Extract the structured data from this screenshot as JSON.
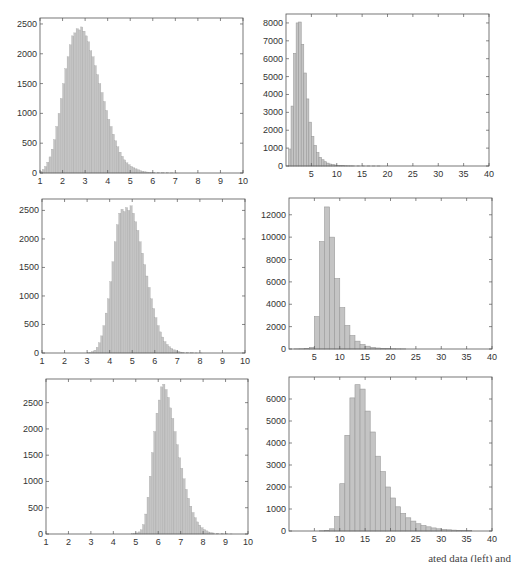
{
  "chart_data": [
    {
      "id": "row1-left",
      "type": "bar",
      "title": "",
      "xlabel": "",
      "ylabel": "",
      "xlim": [
        1,
        10
      ],
      "ylim": [
        0,
        2600
      ],
      "xticks": [
        1,
        2,
        3,
        4,
        5,
        6,
        7,
        8,
        9,
        10
      ],
      "yticks": [
        0,
        500,
        1000,
        1500,
        2000,
        2500
      ],
      "bin_width": 0.1,
      "x": [
        1.0,
        1.1,
        1.2,
        1.3,
        1.4,
        1.5,
        1.6,
        1.7,
        1.8,
        1.9,
        2.0,
        2.1,
        2.2,
        2.3,
        2.4,
        2.5,
        2.6,
        2.7,
        2.8,
        2.9,
        3.0,
        3.1,
        3.2,
        3.3,
        3.4,
        3.5,
        3.6,
        3.7,
        3.8,
        3.9,
        4.0,
        4.1,
        4.2,
        4.3,
        4.4,
        4.5,
        4.6,
        4.7,
        4.8,
        4.9,
        5.0,
        5.1,
        5.2,
        5.3,
        5.4,
        5.5,
        5.6,
        5.7,
        5.8,
        5.9,
        6.0,
        6.2,
        6.4,
        6.6,
        6.8,
        7.0
      ],
      "values": [
        30,
        60,
        110,
        180,
        270,
        400,
        560,
        780,
        1000,
        1250,
        1500,
        1750,
        1950,
        2150,
        2300,
        2350,
        2420,
        2400,
        2450,
        2380,
        2300,
        2200,
        2050,
        1950,
        1800,
        1650,
        1500,
        1350,
        1200,
        1050,
        900,
        780,
        650,
        540,
        440,
        350,
        280,
        220,
        170,
        140,
        110,
        90,
        70,
        55,
        40,
        30,
        22,
        16,
        12,
        9,
        7,
        5,
        4,
        3,
        2,
        1
      ],
      "grid": false
    },
    {
      "id": "row1-right",
      "type": "bar",
      "title": "",
      "xlabel": "",
      "ylabel": "",
      "xlim": [
        0,
        40
      ],
      "ylim": [
        0,
        8500
      ],
      "xticks": [
        5,
        10,
        15,
        20,
        25,
        30,
        35,
        40
      ],
      "yticks": [
        0,
        1000,
        2000,
        3000,
        4000,
        5000,
        6000,
        7000,
        8000
      ],
      "bin_width": 0.5,
      "x": [
        0.5,
        1.0,
        1.5,
        2.0,
        2.5,
        3.0,
        3.5,
        4.0,
        4.5,
        5.0,
        5.5,
        6.0,
        6.5,
        7.0,
        7.5,
        8.0,
        8.5,
        9.0,
        9.5,
        10.0,
        10.5,
        11.0,
        11.5,
        12.0,
        12.5,
        13.0,
        14,
        15,
        16,
        17,
        18
      ],
      "values": [
        950,
        3350,
        6300,
        8000,
        8050,
        6800,
        5200,
        3750,
        2450,
        1650,
        1150,
        750,
        480,
        350,
        240,
        160,
        110,
        80,
        55,
        40,
        30,
        22,
        16,
        12,
        9,
        7,
        5,
        4,
        3,
        2,
        1
      ],
      "grid": false
    },
    {
      "id": "row2-left",
      "type": "bar",
      "title": "",
      "xlabel": "",
      "ylabel": "",
      "xlim": [
        1,
        10
      ],
      "ylim": [
        0,
        2700
      ],
      "xticks": [
        1,
        2,
        3,
        4,
        5,
        6,
        7,
        8,
        9,
        10
      ],
      "yticks": [
        0,
        500,
        1000,
        1500,
        2000,
        2500
      ],
      "bin_width": 0.1,
      "x": [
        3.0,
        3.1,
        3.2,
        3.3,
        3.4,
        3.5,
        3.6,
        3.7,
        3.8,
        3.9,
        4.0,
        4.1,
        4.2,
        4.3,
        4.4,
        4.5,
        4.6,
        4.7,
        4.8,
        4.9,
        5.0,
        5.1,
        5.2,
        5.3,
        5.4,
        5.5,
        5.6,
        5.7,
        5.8,
        5.9,
        6.0,
        6.1,
        6.2,
        6.3,
        6.4,
        6.5,
        6.6,
        6.7,
        6.8,
        6.9,
        7.0,
        7.1,
        7.2,
        7.4,
        7.6,
        7.8,
        8.0
      ],
      "values": [
        5,
        10,
        25,
        50,
        100,
        180,
        300,
        480,
        700,
        950,
        1250,
        1600,
        1950,
        2250,
        2450,
        2520,
        2480,
        2550,
        2500,
        2580,
        2450,
        2300,
        2150,
        1950,
        1750,
        1550,
        1350,
        1150,
        950,
        780,
        620,
        480,
        370,
        280,
        200,
        150,
        110,
        80,
        55,
        40,
        28,
        18,
        12,
        7,
        4,
        2,
        1
      ],
      "grid": false
    },
    {
      "id": "row2-right",
      "type": "bar",
      "title": "",
      "xlabel": "",
      "ylabel": "",
      "xlim": [
        0,
        40
      ],
      "ylim": [
        0,
        13500
      ],
      "xticks": [
        5,
        10,
        15,
        20,
        25,
        30,
        35,
        40
      ],
      "yticks": [
        0,
        2000,
        4000,
        6000,
        8000,
        10000,
        12000
      ],
      "bin_width": 1,
      "x": [
        1,
        2,
        3,
        4,
        5,
        6,
        7,
        8,
        9,
        10,
        11,
        12,
        13,
        14,
        15,
        16,
        17,
        18,
        19,
        20,
        21,
        22
      ],
      "values": [
        10,
        20,
        50,
        150,
        2900,
        9600,
        12700,
        10000,
        6300,
        3700,
        2100,
        1200,
        700,
        400,
        250,
        150,
        90,
        60,
        40,
        25,
        15,
        10
      ],
      "grid": false
    },
    {
      "id": "row3-left",
      "type": "bar",
      "title": "",
      "xlabel": "",
      "ylabel": "",
      "xlim": [
        1,
        10
      ],
      "ylim": [
        0,
        2950
      ],
      "xticks": [
        1,
        2,
        3,
        4,
        5,
        6,
        7,
        8,
        9,
        10
      ],
      "yticks": [
        0,
        500,
        1000,
        1500,
        2000,
        2500
      ],
      "bin_width": 0.1,
      "x": [
        4.8,
        4.9,
        5.0,
        5.1,
        5.2,
        5.3,
        5.4,
        5.5,
        5.6,
        5.7,
        5.8,
        5.9,
        6.0,
        6.1,
        6.2,
        6.3,
        6.4,
        6.5,
        6.6,
        6.7,
        6.8,
        6.9,
        7.0,
        7.1,
        7.2,
        7.3,
        7.4,
        7.5,
        7.6,
        7.7,
        7.8,
        7.9,
        8.0,
        8.1,
        8.2,
        8.3,
        8.4,
        8.6,
        8.8,
        9.0,
        9.2
      ],
      "values": [
        5,
        10,
        20,
        40,
        80,
        180,
        380,
        700,
        1100,
        1550,
        1950,
        2300,
        2550,
        2800,
        2850,
        2750,
        2600,
        2400,
        2200,
        1950,
        1700,
        1450,
        1250,
        1050,
        850,
        680,
        530,
        410,
        310,
        230,
        170,
        120,
        85,
        60,
        40,
        28,
        20,
        12,
        7,
        4,
        2
      ],
      "grid": false
    },
    {
      "id": "row3-right",
      "type": "bar",
      "title": "",
      "xlabel": "",
      "ylabel": "",
      "xlim": [
        0,
        40
      ],
      "ylim": [
        0,
        7000
      ],
      "xticks": [
        5,
        10,
        15,
        20,
        25,
        30,
        35,
        40
      ],
      "yticks": [
        0,
        1000,
        2000,
        3000,
        4000,
        5000,
        6000
      ],
      "bin_width": 1,
      "x": [
        6,
        7,
        8,
        9,
        10,
        11,
        12,
        13,
        14,
        15,
        16,
        17,
        18,
        19,
        20,
        21,
        22,
        23,
        24,
        25,
        26,
        27,
        28,
        29,
        30,
        31,
        32,
        33,
        34,
        35
      ],
      "values": [
        10,
        30,
        100,
        650,
        2150,
        4350,
        6050,
        6650,
        6450,
        5450,
        4500,
        3400,
        2700,
        2000,
        1500,
        1100,
        800,
        600,
        450,
        330,
        250,
        190,
        140,
        100,
        75,
        55,
        40,
        30,
        20,
        15
      ],
      "grid": false
    }
  ],
  "style": {
    "bar_fill": "#c4c4c4",
    "bar_stroke": "#9a9a9a",
    "axis_color": "#555555"
  },
  "caption": "ated data (left) and"
}
